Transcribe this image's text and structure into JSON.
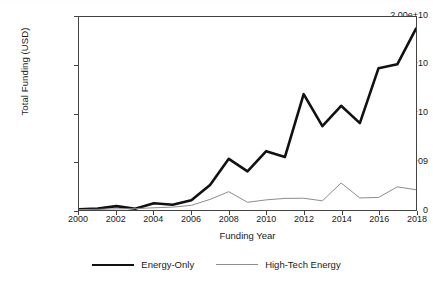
{
  "chart_data": {
    "type": "line",
    "title": "",
    "xlabel": "Funding Year",
    "ylabel": "Total Funding (USD)",
    "x": [
      2000,
      2001,
      2002,
      2003,
      2004,
      2005,
      2006,
      2007,
      2008,
      2009,
      2010,
      2011,
      2012,
      2013,
      2014,
      2015,
      2016,
      2017,
      2018
    ],
    "xlim": [
      2000,
      2018
    ],
    "ylim": [
      0,
      20000000000
    ],
    "grid": false,
    "legend_position": "bottom",
    "x_tick_labels": [
      "2000",
      "2002",
      "2004",
      "2006",
      "2008",
      "2010",
      "2012",
      "2014",
      "2016",
      "2018"
    ],
    "x_tick_values": [
      2000,
      2002,
      2004,
      2006,
      2008,
      2010,
      2012,
      2014,
      2016,
      2018
    ],
    "y_tick_labels": [
      "0",
      "5.00e+09",
      "1.00e+10",
      "1.50e+10",
      "2.00e+10"
    ],
    "y_tick_values": [
      0,
      5000000000,
      10000000000,
      15000000000,
      20000000000
    ],
    "series": [
      {
        "name": "Energy-Only",
        "color": "#111111",
        "width": 2.6,
        "values": [
          80000000,
          150000000,
          400000000,
          130000000,
          700000000,
          550000000,
          1000000000,
          2600000000,
          5300000000,
          4000000000,
          6100000000,
          5500000000,
          12000000000,
          8700000000,
          10800000000,
          9000000000,
          14700000000,
          15100000000,
          18800000000
        ]
      },
      {
        "name": "High-Tech Energy",
        "color": "#8c8c8c",
        "width": 1.0,
        "values": [
          40000000,
          70000000,
          120000000,
          140000000,
          230000000,
          300000000,
          480000000,
          1100000000,
          1900000000,
          800000000,
          1050000000,
          1200000000,
          1220000000,
          950000000,
          2800000000,
          1250000000,
          1300000000,
          2400000000,
          2100000000
        ]
      }
    ]
  }
}
